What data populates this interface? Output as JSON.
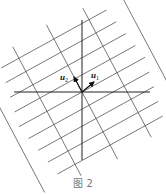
{
  "figure": {
    "caption": "图 2",
    "origin": [
      82,
      92
    ],
    "axes": {
      "horizontal": {
        "x1": 14,
        "x2": 150,
        "y": 92
      },
      "vertical": {
        "x": 82,
        "y1": 20,
        "y2": 160
      }
    },
    "grid": {
      "family_u1": {
        "direction": [
          0.876,
          -0.482
        ],
        "offset_step": 15,
        "offsets": [
          -4,
          -3,
          -2,
          -1,
          0,
          1,
          2,
          3,
          4
        ],
        "half_length": 72
      },
      "family_u2": {
        "direction": [
          0.468,
          0.884
        ],
        "offset_step": 40,
        "offsets": [
          -2,
          -1,
          0,
          1,
          2
        ],
        "half_length": 76
      }
    },
    "vectors": [
      {
        "name": "u1",
        "label": "u",
        "subscript": "1",
        "tip": [
          94,
          82
        ],
        "label_pos": [
          91,
          78
        ]
      },
      {
        "name": "u2",
        "label": "u",
        "subscript": "2",
        "tip": [
          74,
          77
        ],
        "label_pos": [
          60,
          80
        ]
      }
    ],
    "colors": {
      "grid": "#555555",
      "axis": "#222222",
      "vector": "#111111",
      "caption": "#777777"
    }
  }
}
